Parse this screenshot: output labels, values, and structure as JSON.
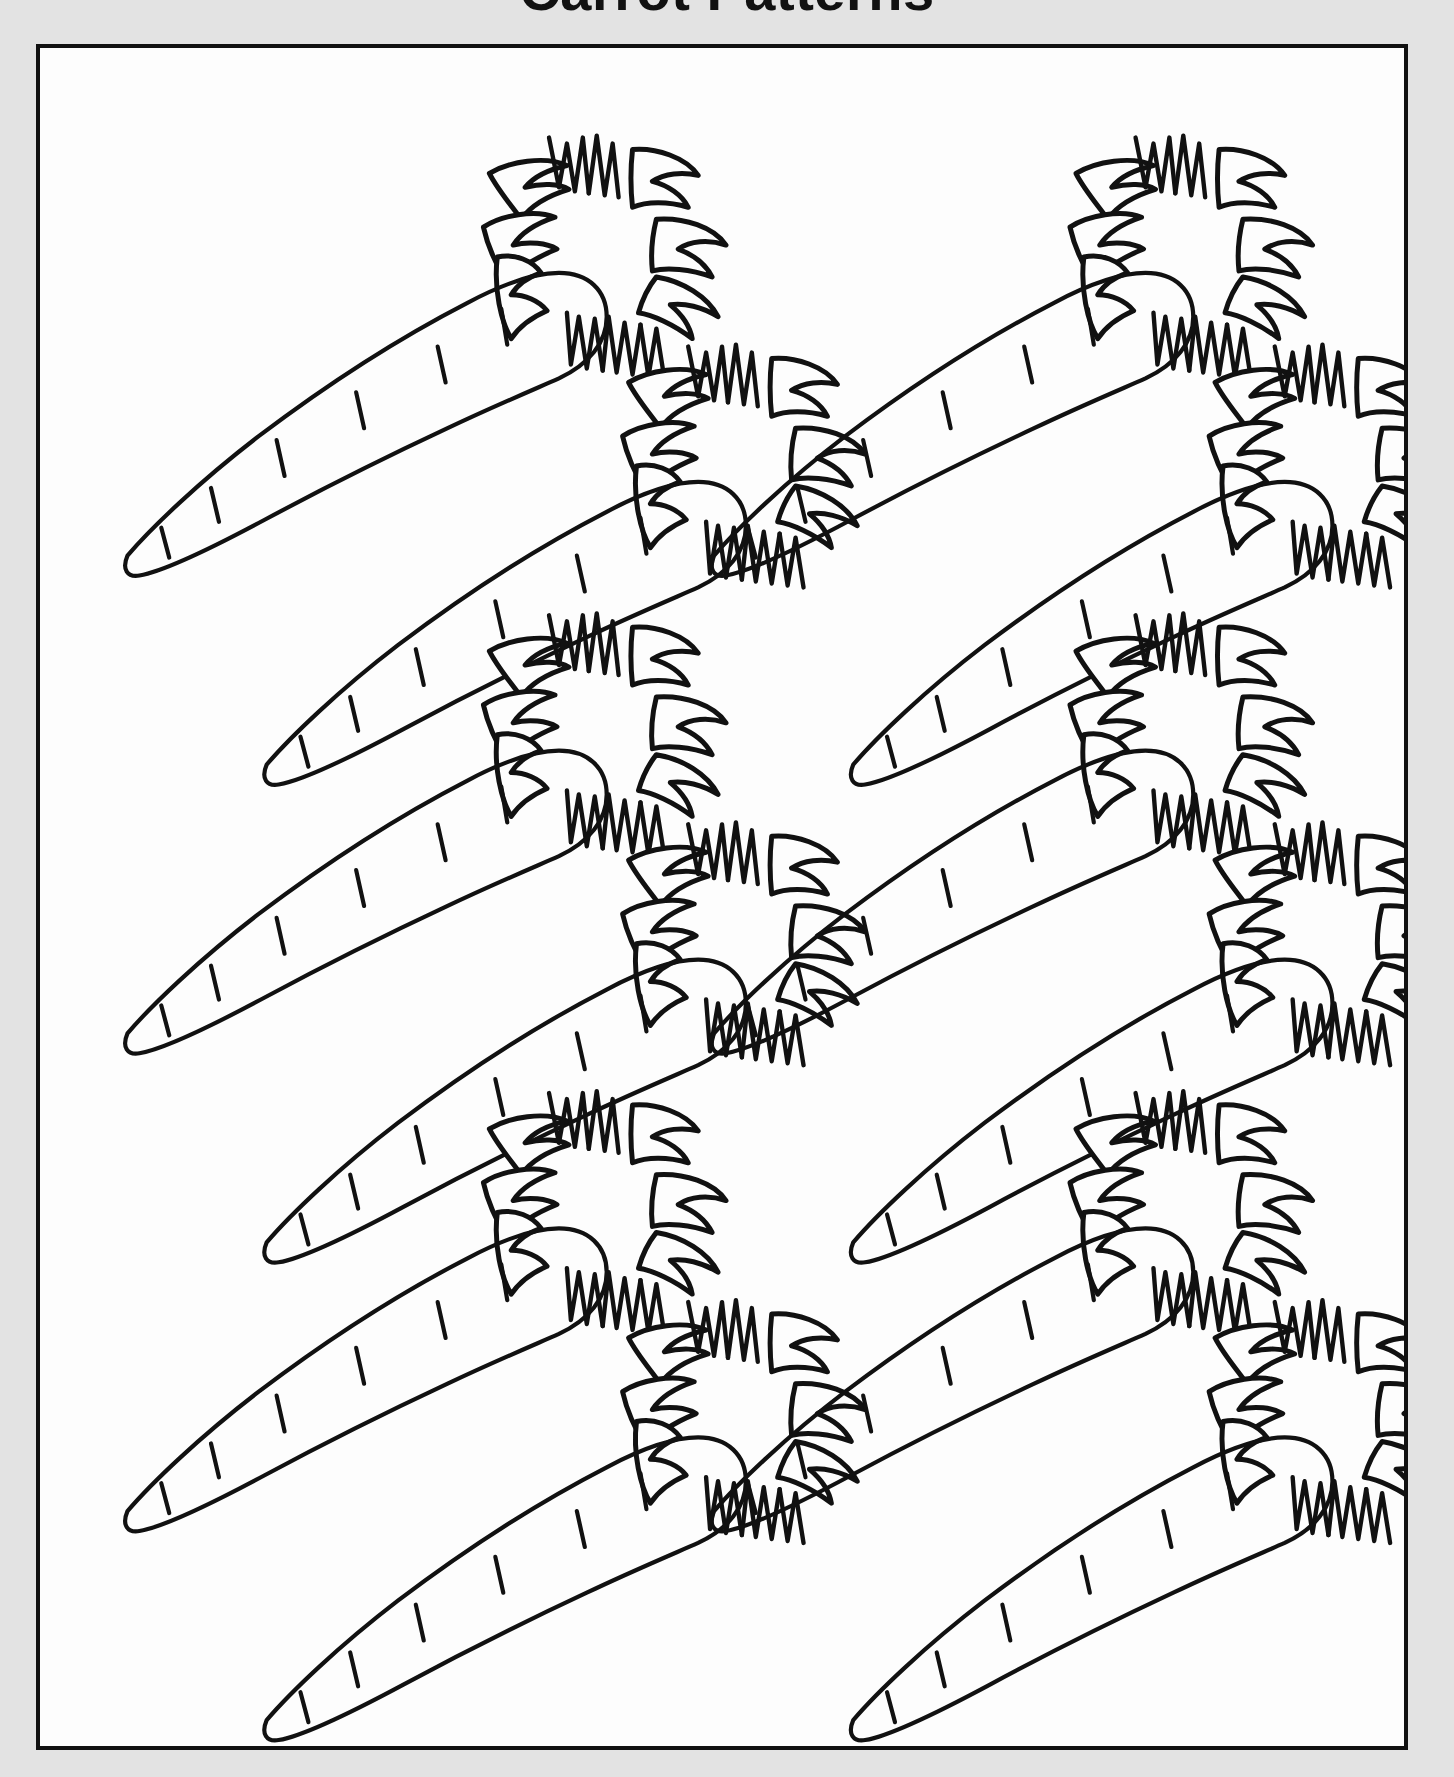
{
  "document": {
    "title": "Carrot Patterns",
    "title_visible_partial": true,
    "page_background_color": "#e3e3e3",
    "sheet_background_color": "#fdfdfd",
    "border_color": "#111111",
    "ink_color": "#111111"
  },
  "artwork": {
    "subject": "carrot",
    "style": "black outline line-art template",
    "total_carrots": 12,
    "columns": 2,
    "rows_per_column": 6,
    "orientation": "diagonal, tip lower-left, leafy top upper-right",
    "body_tick_marks_per_carrot": 6,
    "leaf_fronds_per_top": 12
  },
  "layout": {
    "sheet": {
      "x": 36,
      "y": 44,
      "width": 1372,
      "height": 1706
    },
    "columns_x": [
      0,
      590
    ],
    "carrot_slots": [
      {
        "id": "carrot-1",
        "col": 0,
        "x": 60,
        "y": 30,
        "scale": 1.0
      },
      {
        "id": "carrot-2",
        "col": 0,
        "x": 200,
        "y": 240,
        "scale": 1.0
      },
      {
        "id": "carrot-3",
        "col": 0,
        "x": 60,
        "y": 510,
        "scale": 1.0
      },
      {
        "id": "carrot-4",
        "col": 0,
        "x": 200,
        "y": 720,
        "scale": 1.0
      },
      {
        "id": "carrot-5",
        "col": 0,
        "x": 60,
        "y": 990,
        "scale": 1.0
      },
      {
        "id": "carrot-6",
        "col": 0,
        "x": 200,
        "y": 1200,
        "scale": 1.0
      },
      {
        "id": "carrot-7",
        "col": 1,
        "x": 60,
        "y": 30,
        "scale": 1.0
      },
      {
        "id": "carrot-8",
        "col": 1,
        "x": 200,
        "y": 240,
        "scale": 1.0
      },
      {
        "id": "carrot-9",
        "col": 1,
        "x": 60,
        "y": 510,
        "scale": 1.0
      },
      {
        "id": "carrot-10",
        "col": 1,
        "x": 200,
        "y": 720,
        "scale": 1.0
      },
      {
        "id": "carrot-11",
        "col": 1,
        "x": 60,
        "y": 990,
        "scale": 1.0
      },
      {
        "id": "carrot-12",
        "col": 1,
        "x": 200,
        "y": 1200,
        "scale": 1.0
      }
    ]
  }
}
